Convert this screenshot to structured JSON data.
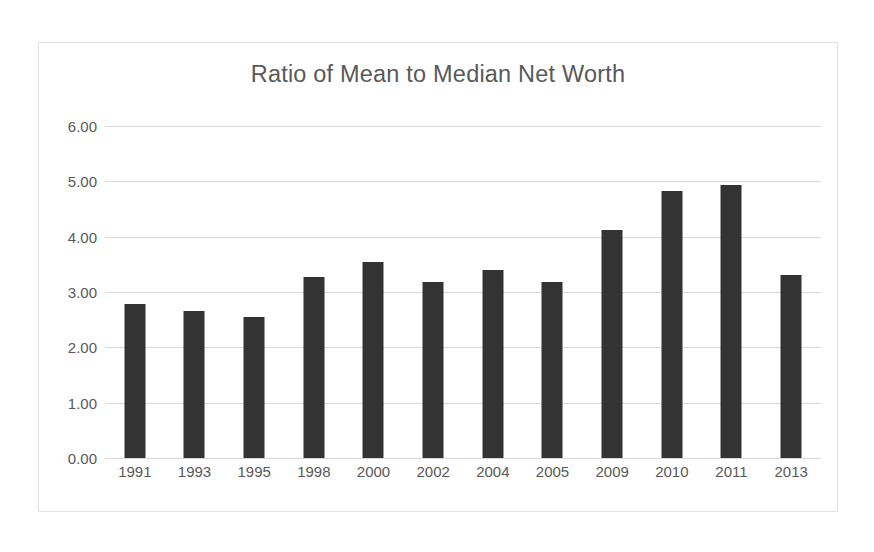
{
  "chart_data": {
    "type": "bar",
    "title": "Ratio of Mean to Median Net Worth",
    "xlabel": "",
    "ylabel": "",
    "categories": [
      "1991",
      "1993",
      "1995",
      "1998",
      "2000",
      "2002",
      "2004",
      "2005",
      "2009",
      "2010",
      "2011",
      "2013"
    ],
    "values": [
      2.78,
      2.65,
      2.55,
      3.26,
      3.53,
      3.17,
      3.39,
      3.17,
      4.12,
      4.82,
      4.92,
      3.31
    ],
    "ylim": [
      0.0,
      6.0
    ],
    "ytick_labels": [
      "6.00",
      "5.00",
      "4.00",
      "3.00",
      "2.00",
      "1.00",
      "0.00"
    ],
    "ytick_values": [
      6.0,
      5.0,
      4.0,
      3.0,
      2.0,
      1.0,
      0.0
    ],
    "grid": true,
    "legend": "none",
    "bar_color": "#333333",
    "gridline_color": "#d9d9d9",
    "text_color": "#595959",
    "frame_border_color": "#e2e2e2",
    "background_color": "#ffffff"
  }
}
